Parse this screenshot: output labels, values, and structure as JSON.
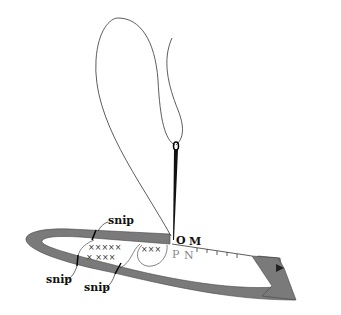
{
  "diagram": {
    "labels": {
      "snip_top": "snip",
      "snip_left": "snip",
      "snip_bottom": "snip",
      "point_o": "O",
      "point_m": "M",
      "point_p": "P",
      "point_n": "N"
    },
    "colors": {
      "fabric": "#7a7a7a",
      "thread": "#333333",
      "needle": "#111111",
      "label_gray": "#888888"
    },
    "cross_stitch_marks": "× × × × ×"
  }
}
